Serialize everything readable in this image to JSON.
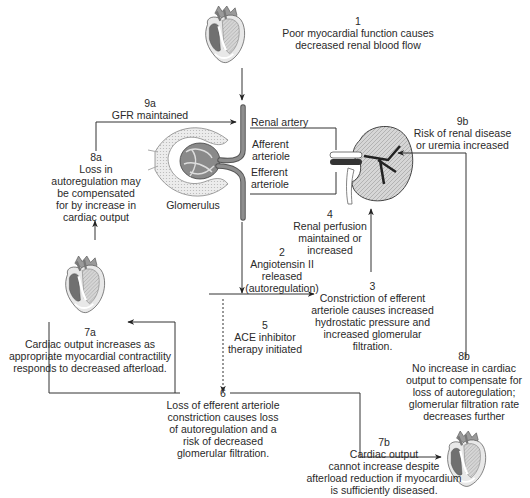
{
  "diagram": {
    "type": "flowchart",
    "topic": "Cardiorenal autoregulation and ACE inhibitor therapy",
    "colors": {
      "line": "#333333",
      "heart_dark": "#6e6e6e",
      "heart_light": "#c8c8c8",
      "kidney": "#9a9a9a",
      "vessel": "#777777"
    }
  },
  "nodes": {
    "n1": {
      "num": "1",
      "lines": [
        "Poor myocardial function causes",
        "decreased renal blood flow"
      ]
    },
    "n2": {
      "num": "2",
      "lines": [
        "Angiotensin II",
        "released",
        "(autoregulation)"
      ]
    },
    "n3": {
      "num": "3",
      "lines": [
        "Constriction of efferent",
        "arteriole causes increased",
        "hydrostatic pressure and",
        "increased glomerular",
        "filtration."
      ]
    },
    "n4": {
      "num": "4",
      "lines": [
        "Renal perfusion",
        "maintained or",
        "increased"
      ]
    },
    "n5": {
      "num": "5",
      "lines": [
        "ACE inhibitor",
        "therapy initiated"
      ]
    },
    "n6": {
      "num": "6",
      "lines": [
        "Loss of efferent arteriole",
        "constriction causes loss",
        "of autoregulation and a",
        "risk of decreased",
        "glomerular filtration."
      ]
    },
    "n7a": {
      "num": "7a",
      "lines": [
        "Cardiac output increases as",
        "appropriate myocardial contractility",
        "responds to decreased afterload."
      ]
    },
    "n7b": {
      "num": "7b",
      "lines": [
        "Cardiac output",
        "cannot increase despite",
        "afterload reduction if myocardium",
        "is sufficiently diseased."
      ]
    },
    "n8a": {
      "num": "8a",
      "lines": [
        "Loss in",
        "autoregulation may",
        "be compensated",
        "for by increase in",
        "cardiac output"
      ]
    },
    "n8b": {
      "num": "8b",
      "lines": [
        "No increase in cardiac",
        "output to compensate for",
        "loss of autoregulation;",
        "glomerular filtration rate",
        "decreases further"
      ]
    },
    "n9a": {
      "num": "9a",
      "lines": [
        "GFR maintained"
      ]
    },
    "n9b": {
      "num": "9b",
      "lines": [
        "Risk of renal disease",
        "or uremia increased"
      ]
    }
  },
  "anatomy_labels": {
    "renal_artery": "Renal artery",
    "afferent": [
      "Afferent",
      "arteriole"
    ],
    "efferent": [
      "Efferent",
      "arteriole"
    ],
    "glomerulus": "Glomerulus"
  },
  "illustrations": [
    "heart-top",
    "heart-left",
    "heart-bottom-right",
    "kidney",
    "glomerulus"
  ],
  "edges": [
    {
      "from": "n1",
      "to": "n2",
      "style": "solid"
    },
    {
      "from": "n2",
      "to": "n3",
      "style": "solid"
    },
    {
      "from": "n3",
      "to": "n4",
      "style": "solid"
    },
    {
      "from": "n2",
      "to": "n6",
      "style": "dotted",
      "via": "n5"
    },
    {
      "from": "n6",
      "to": "n7a",
      "style": "solid"
    },
    {
      "from": "n6",
      "to": "n7b",
      "style": "solid"
    },
    {
      "from": "n7a",
      "to": "n8a",
      "style": "solid"
    },
    {
      "from": "n8a",
      "to": "n9a",
      "style": "solid"
    },
    {
      "from": "n7b",
      "to": "n8b",
      "style": "solid"
    },
    {
      "from": "n8b",
      "to": "n9b",
      "style": "solid"
    }
  ]
}
